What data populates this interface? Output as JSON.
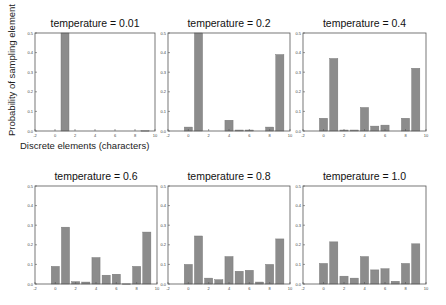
{
  "figure": {
    "ylabel": "Probability of sampling element",
    "xlabel": "Discrete elements (characters)",
    "bar_color": "#8c8c8c",
    "axis_color": "#555555"
  },
  "chart_data": [
    {
      "type": "bar",
      "title": "temperature = 0.01",
      "xlabel": "Discrete elements (characters)",
      "ylabel": "Probability of sampling element",
      "categories": [
        0,
        1,
        2,
        3,
        4,
        5,
        6,
        7,
        8,
        9
      ],
      "values": [
        0.0,
        0.5,
        0.0,
        0.0,
        0.0,
        0.0,
        0.0,
        0.0,
        0.0,
        0.002
      ],
      "xlim": [
        -2,
        10
      ],
      "ylim": [
        0,
        0.5
      ],
      "xticks": [
        -2,
        0,
        2,
        4,
        6,
        8,
        10
      ],
      "yticks": [
        0.0,
        0.1,
        0.2,
        0.3,
        0.4,
        0.5
      ],
      "grid": false
    },
    {
      "type": "bar",
      "title": "temperature = 0.2",
      "categories": [
        0,
        1,
        2,
        3,
        4,
        5,
        6,
        7,
        8,
        9
      ],
      "values": [
        0.02,
        0.5,
        0.0,
        0.0,
        0.055,
        0.005,
        0.005,
        0.0,
        0.02,
        0.39
      ],
      "xlim": [
        -2,
        10
      ],
      "ylim": [
        0,
        0.5
      ],
      "xticks": [
        -2,
        0,
        2,
        4,
        6,
        8,
        10
      ],
      "yticks": [
        0.0,
        0.1,
        0.2,
        0.3,
        0.4,
        0.5
      ],
      "grid": false
    },
    {
      "type": "bar",
      "title": "temperature = 0.4",
      "categories": [
        0,
        1,
        2,
        3,
        4,
        5,
        6,
        7,
        8,
        9
      ],
      "values": [
        0.065,
        0.37,
        0.005,
        0.005,
        0.12,
        0.025,
        0.03,
        0.0,
        0.065,
        0.32
      ],
      "xlim": [
        -2,
        10
      ],
      "ylim": [
        0,
        0.5
      ],
      "xticks": [
        -2,
        0,
        2,
        4,
        6,
        8,
        10
      ],
      "yticks": [
        0.0,
        0.1,
        0.2,
        0.3,
        0.4,
        0.5
      ],
      "grid": false
    },
    {
      "type": "bar",
      "title": "temperature = 0.6",
      "categories": [
        0,
        1,
        2,
        3,
        4,
        5,
        6,
        7,
        8,
        9
      ],
      "values": [
        0.09,
        0.29,
        0.012,
        0.01,
        0.135,
        0.045,
        0.05,
        0.001,
        0.09,
        0.265
      ],
      "xlim": [
        -2,
        10
      ],
      "ylim": [
        0,
        0.5
      ],
      "xticks": [
        -2,
        0,
        2,
        4,
        6,
        8,
        10
      ],
      "yticks": [
        0.0,
        0.1,
        0.2,
        0.3,
        0.4,
        0.5
      ],
      "grid": false
    },
    {
      "type": "bar",
      "title": "temperature = 0.8",
      "categories": [
        0,
        1,
        2,
        3,
        4,
        5,
        6,
        7,
        8,
        9
      ],
      "values": [
        0.1,
        0.245,
        0.03,
        0.022,
        0.14,
        0.065,
        0.07,
        0.01,
        0.1,
        0.23
      ],
      "xlim": [
        -2,
        10
      ],
      "ylim": [
        0,
        0.5
      ],
      "xticks": [
        -2,
        0,
        2,
        4,
        6,
        8,
        10
      ],
      "yticks": [
        0.0,
        0.1,
        0.2,
        0.3,
        0.4,
        0.5
      ],
      "grid": false
    },
    {
      "type": "bar",
      "title": "temperature = 1.0",
      "categories": [
        0,
        1,
        2,
        3,
        4,
        5,
        6,
        7,
        8,
        9
      ],
      "values": [
        0.105,
        0.215,
        0.04,
        0.03,
        0.14,
        0.072,
        0.078,
        0.014,
        0.105,
        0.205
      ],
      "xlim": [
        -2,
        10
      ],
      "ylim": [
        0,
        0.5
      ],
      "xticks": [
        -2,
        0,
        2,
        4,
        6,
        8,
        10
      ],
      "yticks": [
        0.0,
        0.1,
        0.2,
        0.3,
        0.4,
        0.5
      ],
      "grid": false
    }
  ]
}
